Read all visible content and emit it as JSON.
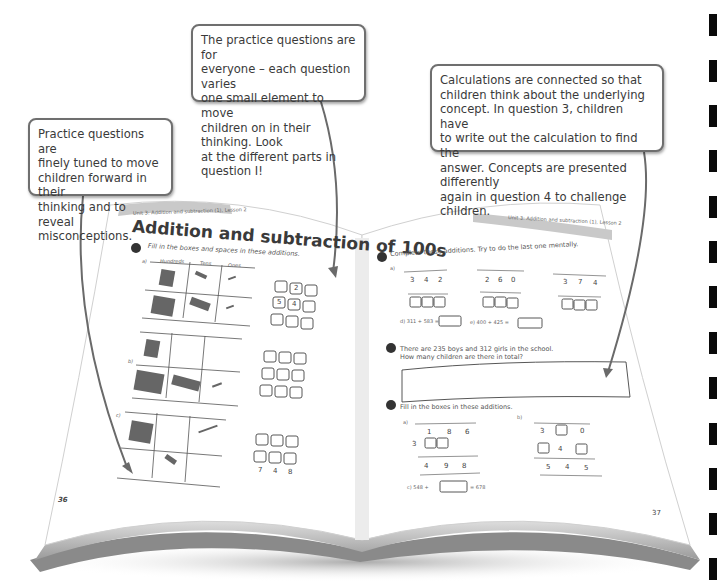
{
  "callouts": [
    {
      "id": "c1",
      "lines": [
        "Practice questions are",
        "finely tuned to move",
        "children forward in their",
        "thinking and to reveal",
        "misconceptions."
      ]
    },
    {
      "id": "c2",
      "lines": [
        "The practice questions are for",
        "everyone – each question varies",
        "one small element to move",
        "children on in their thinking. Look",
        "at the different parts in question I!"
      ]
    },
    {
      "id": "c3",
      "lines": [
        "Calculations are connected so that",
        "children think about the underlying",
        "concept. In question 3, children have",
        "to write out the calculation to find the",
        "answer. Concepts are presented differently",
        "again in question 4 to challenge children."
      ]
    }
  ],
  "book": {
    "left_page": {
      "header": "Unit 3: Addition and subtraction (1), Lesson 2",
      "title": "Addition and subtraction of 100s",
      "question_1": {
        "number": "1",
        "instruction": "Fill in the boxes and spaces in these additions.",
        "table_headers": [
          "Hundreds",
          "Tens",
          "Ones"
        ],
        "column_headers": [
          "H",
          "T",
          "O"
        ],
        "parts": [
          {
            "label": "a)",
            "row1": [
              "",
              "2",
              ""
            ],
            "row2": [
              "5",
              "4",
              ""
            ],
            "answer": [
              "",
              "",
              ""
            ]
          },
          {
            "label": "b)",
            "row1": [
              "",
              "",
              ""
            ],
            "row2": [
              "",
              "",
              ""
            ],
            "answer": [
              "",
              "",
              ""
            ]
          },
          {
            "label": "c)",
            "row1": [
              "",
              "",
              ""
            ],
            "row2": [
              "",
              "",
              ""
            ],
            "answer": [
              "7",
              "4",
              "8"
            ]
          }
        ],
        "plus": "+"
      },
      "page_number": "36"
    },
    "right_page": {
      "header": "Unit 3: Addition and subtraction (1), Lesson 2",
      "question_2": {
        "number": "2",
        "instruction": "Complete these additions. Try to do the last one mentally.",
        "column_headers": [
          "H",
          "T",
          "O"
        ],
        "parts": [
          {
            "label": "a)",
            "top": [
              "3",
              "4",
              "2"
            ],
            "add": [
              "4",
              "5",
              "6"
            ]
          },
          {
            "label": "b)",
            "top": [
              "2",
              "6",
              "0"
            ],
            "add": [
              "7",
              "1",
              "2"
            ]
          },
          {
            "label": "c)",
            "top": [
              "3",
              "7",
              "4"
            ],
            "add": [
              "",
              "2",
              "3"
            ]
          }
        ],
        "d": "d) 311 + 583 =",
        "e": "e) 400 + 425 ="
      },
      "question_3": {
        "number": "3",
        "line1": "There are 235 boys and 312 girls in the school.",
        "line2": "How many children are there in total?"
      },
      "question_4": {
        "number": "4",
        "instruction": "Fill in the boxes in these additions.",
        "column_headers": [
          "H",
          "T",
          "O"
        ],
        "a": {
          "label": "a)",
          "top": [
            "1",
            "8",
            "6"
          ],
          "add": [
            "3",
            "",
            ""
          ],
          "answer": [
            "4",
            "9",
            "8"
          ]
        },
        "b": {
          "label": "b)",
          "top": [
            "3",
            "",
            "0"
          ],
          "add": [
            "",
            "4",
            ""
          ],
          "answer": [
            "5",
            "4",
            "5"
          ]
        },
        "c_left": "c) 548 +",
        "c_right": "= 678"
      },
      "page_number": "37"
    }
  }
}
